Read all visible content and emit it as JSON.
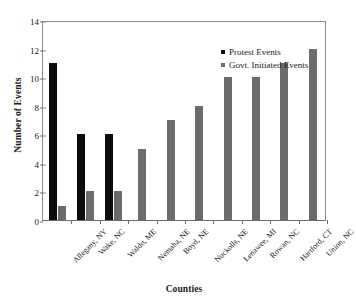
{
  "chart_data": {
    "type": "bar",
    "title": "",
    "subtitle": "",
    "xlabel": "Counties",
    "ylabel": "Number of Events",
    "ylim": [
      0,
      14
    ],
    "ytick_step": 2,
    "yticks": [
      0,
      2,
      4,
      6,
      8,
      10,
      12,
      14
    ],
    "grid": false,
    "legend_position": "top-right-inside",
    "categories": [
      "Allegany, NY",
      "Wake, NC",
      "Waldo, ME",
      "Nemaha, NE",
      "Boyd, NE",
      "Nuckolls, NE",
      "Lenawee, MI",
      "Rowan, NC",
      "Hartford, CT",
      "Union, NC"
    ],
    "series": [
      {
        "name": "Protest Events",
        "color": "#0d0d0d",
        "values": [
          11,
          6,
          6,
          0,
          0,
          0,
          0,
          0,
          0,
          0
        ]
      },
      {
        "name": "Govt. Initiated Events",
        "color": "#6b6b6b",
        "values": [
          1,
          2,
          2,
          5,
          7,
          8,
          10,
          10,
          11,
          12
        ]
      }
    ]
  }
}
